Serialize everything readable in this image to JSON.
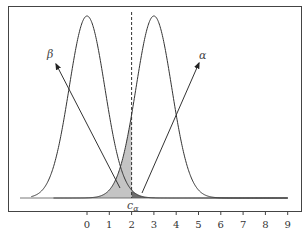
{
  "chart_data": {
    "type": "area",
    "title": "",
    "xlabel": "",
    "ylabel": "",
    "x_ticks": [
      "0",
      "1",
      "2",
      "3",
      "4",
      "5",
      "6",
      "7",
      "8",
      "9"
    ],
    "xlim": [
      -3.5,
      9.5
    ],
    "grid": false,
    "series": [
      {
        "name": "H0 distribution",
        "mean": 0,
        "sd": 0.8
      },
      {
        "name": "H1 distribution",
        "mean": 3,
        "sd": 0.8
      }
    ],
    "critical_value": {
      "label": "c_α",
      "x": 2
    },
    "shaded_regions": [
      {
        "name": "beta",
        "label": "β",
        "description": "area of H1 curve left of c_α",
        "color": "#c4c4c4"
      },
      {
        "name": "alpha",
        "label": "α",
        "description": "area of H0 curve right of c_α",
        "color": "#6e6e6e"
      }
    ],
    "annotations": [
      {
        "text": "β",
        "arrow_to": "beta region"
      },
      {
        "text": "α",
        "arrow_to": "alpha region"
      },
      {
        "text": "c",
        "subscript": "α"
      }
    ]
  }
}
